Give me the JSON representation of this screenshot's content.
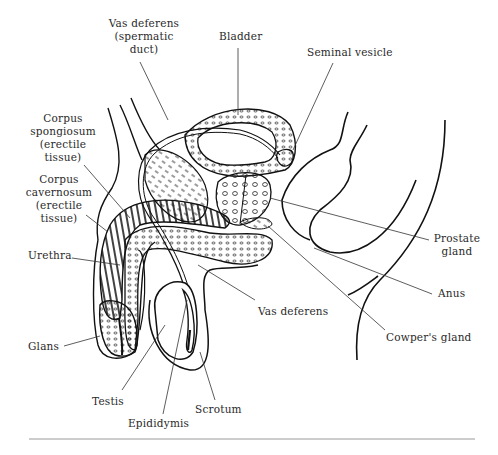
{
  "diagram": {
    "labels": {
      "vas_deferens_top": "Vas deferens\n(spermatic\nduct)",
      "bladder": "Bladder",
      "seminal_vesicle": "Seminal vesicle",
      "corpus_spongiosum": "Corpus\nspongiosum\n(erectile\ntissue)",
      "corpus_cavernosum": "Corpus\ncavernosum\n(erectile\ntissue)",
      "urethra": "Urethra",
      "glans": "Glans",
      "testis": "Testis",
      "epididymis": "Epididymis",
      "scrotum": "Scrotum",
      "vas_deferens_bottom": "Vas deferens",
      "cowpers_gland": "Cowper's gland",
      "anus": "Anus",
      "prostate_gland": "Prostate\ngland"
    },
    "colors": {
      "ink": "#1a1a1a",
      "leader": "#333333",
      "rule": "#9a9a9a",
      "background": "#ffffff"
    }
  }
}
